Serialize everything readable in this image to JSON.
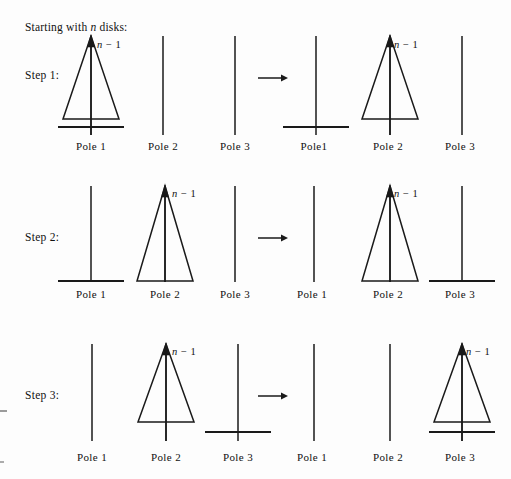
{
  "figure": {
    "title_text": "Starting with n disks:",
    "title_prefix": "Starting with ",
    "title_var": "n",
    "title_suffix": " disks:",
    "background_color": "#fdfdfd",
    "line_color": "#1a1a1a",
    "text_color": "#111111",
    "width": 511,
    "height": 479
  },
  "stack_label": {
    "var": "n",
    "minus": " − ",
    "count": "1",
    "full": "n − 1"
  },
  "rows": [
    {
      "step_label": "Step 1:",
      "left": {
        "poles": [
          {
            "label": "Pole 1",
            "has_stack": true,
            "has_disk_bar": true
          },
          {
            "label": "Pole 2",
            "has_stack": false,
            "has_disk_bar": false
          },
          {
            "label": "Pole 3",
            "has_stack": false,
            "has_disk_bar": false
          }
        ]
      },
      "arrow": "→",
      "right": {
        "poles": [
          {
            "label": "Pole1",
            "has_stack": false,
            "has_disk_bar": true
          },
          {
            "label": "Pole 2",
            "has_stack": true,
            "has_disk_bar": false
          },
          {
            "label": "Pole 3",
            "has_stack": false,
            "has_disk_bar": false
          }
        ]
      }
    },
    {
      "step_label": "Step 2:",
      "left": {
        "poles": [
          {
            "label": "Pole 1",
            "has_stack": false,
            "has_disk_bar": true
          },
          {
            "label": "Pole 2",
            "has_stack": true,
            "has_disk_bar": false
          },
          {
            "label": "Pole 3",
            "has_stack": false,
            "has_disk_bar": false
          }
        ]
      },
      "arrow": "→",
      "right": {
        "poles": [
          {
            "label": "Pole 1",
            "has_stack": false,
            "has_disk_bar": false
          },
          {
            "label": "Pole 2",
            "has_stack": true,
            "has_disk_bar": false
          },
          {
            "label": "Pole 3",
            "has_stack": false,
            "has_disk_bar": true
          }
        ]
      }
    },
    {
      "step_label": "Step 3:",
      "left": {
        "poles": [
          {
            "label": "Pole 1",
            "has_stack": false,
            "has_disk_bar": false
          },
          {
            "label": "Pole 2",
            "has_stack": true,
            "has_disk_bar": false
          },
          {
            "label": "Pole 3",
            "has_stack": false,
            "has_disk_bar": true
          }
        ]
      },
      "arrow": "→",
      "right": {
        "poles": [
          {
            "label": "Pole 1",
            "has_stack": false,
            "has_disk_bar": false
          },
          {
            "label": "Pole 2",
            "has_stack": false,
            "has_disk_bar": false
          },
          {
            "label": "Pole 3",
            "has_stack": true,
            "has_disk_bar": true
          }
        ]
      }
    }
  ]
}
